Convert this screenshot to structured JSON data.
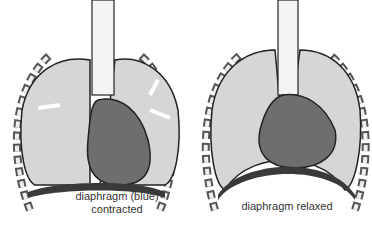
{
  "figure": {
    "panels": [
      {
        "id": "inhale",
        "label_line1": "diaphragm (blue)",
        "label_line2": "contracted"
      },
      {
        "id": "exhale",
        "label_line1": "diaphragm relaxed",
        "label_line2": ""
      }
    ],
    "colors": {
      "lung": "#d6d6d6",
      "heart": "#6e6e6e",
      "heart_dark": "#4e4e4e",
      "diaphragm": "#3a3a3a",
      "outline": "#222222",
      "rib": "#8a8a8a"
    }
  }
}
